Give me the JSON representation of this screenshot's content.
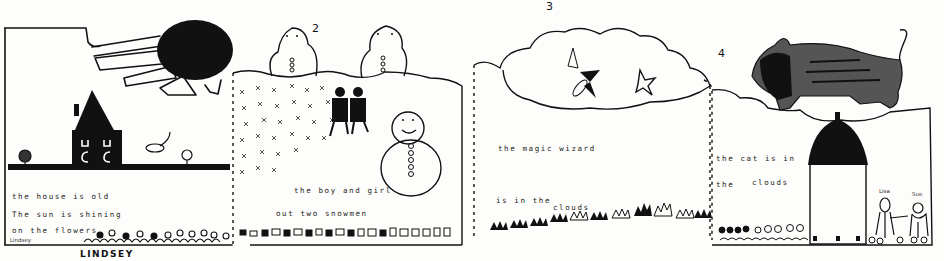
{
  "artwork": {
    "type": "child's hand-drawn story strip",
    "author_signature": "LINDSEY",
    "panels": [
      {
        "number": "",
        "lines": [
          "the house is old",
          "The sun is shining",
          "on the flowers"
        ],
        "small_name": "Lindsey",
        "elements": [
          "sun",
          "house",
          "flowers",
          "ground"
        ]
      },
      {
        "number": "2",
        "lines": [
          "the boy and girl",
          "out two snowmen"
        ],
        "elements": [
          "snowman",
          "snowman",
          "snowman",
          "two children",
          "snow"
        ]
      },
      {
        "number": "3",
        "lines": [
          "the magic wizard",
          "is in the",
          "clouds"
        ],
        "elements": [
          "cloud",
          "wizard",
          "star",
          "grass"
        ]
      },
      {
        "number": "4",
        "lines": [
          "the cat is in",
          "the",
          "clouds"
        ],
        "figure_labels": [
          "Lisa",
          "Sue"
        ],
        "elements": [
          "cat",
          "cloud",
          "house",
          "flowers",
          "two girls"
        ]
      }
    ]
  },
  "colors": {
    "ink": "#111111",
    "paper": "#fdfdfb"
  }
}
